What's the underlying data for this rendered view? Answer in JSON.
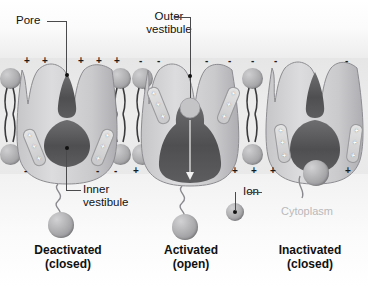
{
  "diagram": {
    "background_colors": {
      "extracellular": "#fbfbfb",
      "membrane": "#e9e9ea",
      "cytoplasm": "#fbfbfb",
      "protein_fill": "#d5d5d7",
      "pore_fill": "#5a5a5a",
      "lipid_head": "#b0b0b3"
    }
  },
  "labels": {
    "pore": "Pore",
    "outer_vestibule": "Outer\nvestibule",
    "inner_vestibule": "Inner\nvestibule",
    "ion": "Ion",
    "cytoplasm": "Cytoplasm"
  },
  "states": [
    {
      "id": "deactivated",
      "name": "Deactivated",
      "condition": "(closed)",
      "label": "Deactivated\n(closed)"
    },
    {
      "id": "activated",
      "name": "Activated",
      "condition": "(open)",
      "label": "Activated\n(open)"
    },
    {
      "id": "inactivated",
      "name": "Inactivated",
      "condition": "(closed)",
      "label": "Inactivated\n(closed)"
    }
  ],
  "membrane": {
    "outer_charges": [
      "+",
      "+",
      "+",
      "+",
      "+",
      "-",
      "-",
      "-",
      "-",
      "-",
      "-",
      "-"
    ],
    "inner_charges": [
      "-",
      "-",
      "-",
      "+",
      "+",
      "+",
      "+",
      "+"
    ],
    "sensor_charges": [
      "+",
      "+",
      "+"
    ]
  }
}
